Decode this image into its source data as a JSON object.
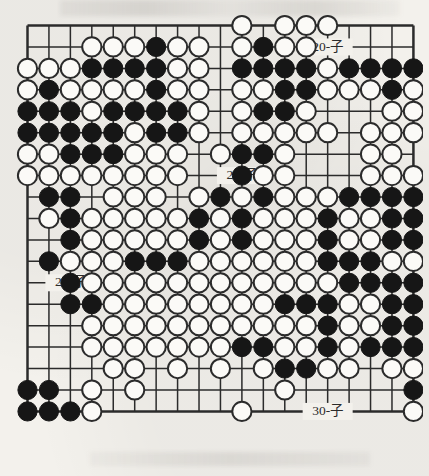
{
  "document": {
    "type": "go-board-diagram",
    "title": "Go board position diagram",
    "board_size": 19,
    "stone_colors": {
      "black": "#161616",
      "white": "#fbfaf7",
      "line": "#2b2b2b",
      "paper": "#f3f1ec"
    }
  },
  "annotations": [
    {
      "id": "label-top-right",
      "text": "20-子",
      "col": 14,
      "row": 1
    },
    {
      "id": "label-middle",
      "text": "20-子",
      "col": 10,
      "row": 7
    },
    {
      "id": "label-left",
      "text": "20-子",
      "col": 2,
      "row": 12
    },
    {
      "id": "label-bottom-right",
      "text": "30-子",
      "col": 14,
      "row": 18
    }
  ],
  "board": {
    "legend": {
      ".": "empty",
      "B": "black",
      "W": "white"
    },
    "rows": [
      "..........W.WWW....",
      "...WWWBWW.WBWW.....",
      "WWWBBBBWW.BBBBWBBBB",
      "WBWWWWBWW.WWBBWWWBW",
      "BBBWBBBBW.WBBW...WW",
      "BBBBBWBBW.WWWWW.WWW",
      "WWBBBWWW.WBBW...WW.",
      "WWWWWWWW..BWW...WWW",
      ".BB.WWW.WBWBWWWBBBB",
      ".WBWWWWWBWBWWWBWWBB",
      "..BWWWWWBWBWWWBWWBB",
      ".BWWWBBBWWWWWWBBBWW",
      "..BWWWWWWWWWWWWBBBB",
      "..BBWWWWWWWWBBBWWBB",
      "...WWWWWWWWWWWBWWBB",
      "...WWWWWWWBBWWBWBBB",
      "....WW.W.W.WBBWW.WW",
      "BB.W.W......W.....B",
      "BBBW......W.......W"
    ]
  }
}
